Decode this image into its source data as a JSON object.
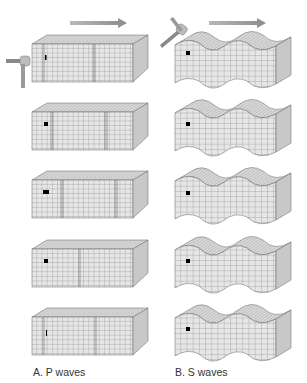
{
  "figure": {
    "panels": [
      {
        "id": "A",
        "caption": "A. P waves",
        "wave_type": "compressional",
        "frames": 5,
        "direction": "right"
      },
      {
        "id": "B",
        "caption": "B. S waves",
        "wave_type": "shear",
        "frames": 5,
        "direction": "right"
      }
    ],
    "colors": {
      "grid_line": "#6a6a6a",
      "face_front": "#e4e4e4",
      "face_top": "#d2d2d2",
      "face_side": "#c4c4c4",
      "marker": "#000000",
      "arrow": "#a0a0a0"
    },
    "icons": [
      "hammer-icon",
      "direction-arrow-icon",
      "particle-marker-icon"
    ]
  }
}
